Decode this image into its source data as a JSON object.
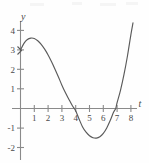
{
  "figure": {
    "name": "cubic-curve-graph",
    "background_color": "#fefefe",
    "curve_color": "#5a5a5a",
    "axis_color": "#8a8a8a",
    "label_color": "#4a4a4a"
  },
  "chart_data": {
    "type": "line",
    "title": "",
    "subtitle": "",
    "xlabel": "t",
    "ylabel": "y",
    "grid": false,
    "legend": null,
    "xlim": [
      -0.6,
      8.8
    ],
    "ylim": [
      -2.45,
      4.8
    ],
    "xticks": [
      1,
      2,
      3,
      4,
      5,
      6,
      7,
      8
    ],
    "xtick_labels": [
      "1",
      "2",
      "3",
      "4",
      "5",
      "6",
      "7",
      "8"
    ],
    "yticks": [
      -2,
      -1,
      1,
      2,
      3,
      4
    ],
    "ytick_labels": [
      "-2",
      "-1",
      "1",
      "2",
      "3",
      "4"
    ],
    "annotations": [],
    "series": [
      {
        "name": "y(t)",
        "x": [
          0.0,
          0.25,
          0.5,
          0.75,
          1.0,
          1.25,
          1.5,
          1.75,
          2.0,
          2.25,
          2.5,
          2.75,
          3.0,
          3.25,
          3.5,
          3.75,
          3.9,
          4.0,
          4.25,
          4.5,
          4.75,
          5.0,
          5.25,
          5.5,
          5.75,
          6.0,
          6.25,
          6.5,
          6.75,
          6.9,
          7.0,
          7.25,
          7.5,
          7.75,
          8.0,
          8.15
        ],
        "y": [
          3.0,
          3.35,
          3.55,
          3.62,
          3.6,
          3.48,
          3.3,
          3.05,
          2.75,
          2.4,
          2.02,
          1.62,
          1.2,
          0.82,
          0.48,
          0.15,
          0.0,
          -0.12,
          -0.55,
          -0.95,
          -1.22,
          -1.4,
          -1.5,
          -1.52,
          -1.45,
          -1.28,
          -1.0,
          -0.62,
          -0.18,
          0.0,
          0.3,
          0.95,
          1.75,
          2.7,
          3.8,
          4.4
        ]
      }
    ],
    "features": {
      "y_intercept": 3.0,
      "local_maximum": {
        "t": 1.0,
        "y": 3.6
      },
      "local_minimum": {
        "t": 5.5,
        "y": -1.5
      },
      "zeros": [
        3.9,
        6.9
      ]
    }
  }
}
